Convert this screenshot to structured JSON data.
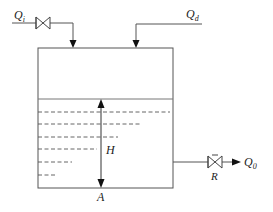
{
  "diagram": {
    "labels": {
      "inflow": "Q",
      "inflow_sub": "i",
      "disturbance": "Q",
      "disturbance_sub": "d",
      "outflow": "Q",
      "outflow_sub": "0",
      "height": "H",
      "area": "A",
      "resistance": "R"
    },
    "colors": {
      "line": "#555555",
      "water_line": "#777777",
      "arrow": "#111111",
      "background": "#ffffff"
    },
    "components": [
      {
        "id": "inlet-valve",
        "type": "valve",
        "label": ""
      },
      {
        "id": "outlet-valve",
        "type": "valve",
        "label": "R"
      },
      {
        "id": "tank",
        "type": "tank",
        "cross_section_area": "A"
      },
      {
        "id": "level",
        "type": "dimension-arrow",
        "label": "H"
      }
    ]
  }
}
